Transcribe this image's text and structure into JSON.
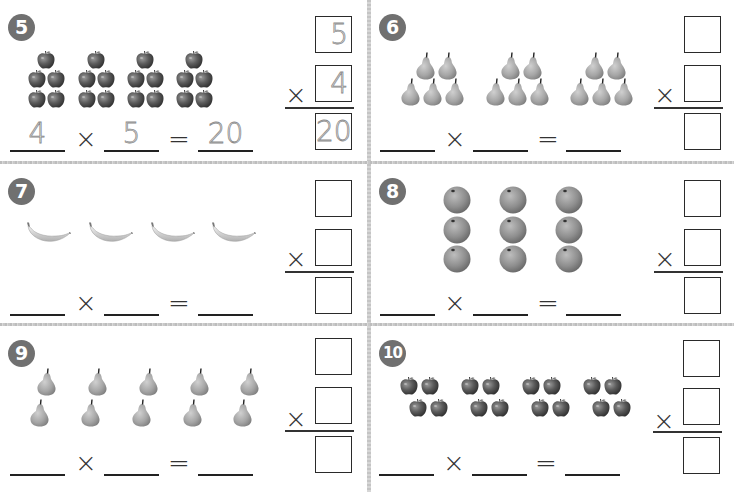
{
  "worksheet": {
    "type": "multiplication arrays",
    "problems": [
      {
        "number": "5",
        "fruit": "apple",
        "arrangement": "4 groups of 5 (pyramid: 1 on top, 2x2 below)",
        "groups": 4,
        "per_group": 5,
        "equation": {
          "factor1": "4",
          "operator": "×",
          "factor2": "5",
          "equals": "=",
          "product": "20"
        },
        "vertical": {
          "top": "5",
          "operator": "×",
          "bottom": "4",
          "result": "20"
        }
      },
      {
        "number": "6",
        "fruit": "pear",
        "arrangement": "3 groups of 5 (2 on top, 3 below)",
        "groups": 3,
        "per_group": 5,
        "equation": {
          "factor1": "",
          "operator": "×",
          "factor2": "",
          "equals": "=",
          "product": ""
        },
        "vertical": {
          "top": "",
          "operator": "×",
          "bottom": "",
          "result": ""
        }
      },
      {
        "number": "7",
        "fruit": "banana",
        "arrangement": "4 bananas in a row",
        "groups": 4,
        "per_group": 1,
        "equation": {
          "factor1": "",
          "operator": "×",
          "factor2": "",
          "equals": "=",
          "product": ""
        },
        "vertical": {
          "top": "",
          "operator": "×",
          "bottom": "",
          "result": ""
        }
      },
      {
        "number": "8",
        "fruit": "orange",
        "arrangement": "3 columns of 3",
        "groups": 3,
        "per_group": 3,
        "equation": {
          "factor1": "",
          "operator": "×",
          "factor2": "",
          "equals": "=",
          "product": ""
        },
        "vertical": {
          "top": "",
          "operator": "×",
          "bottom": "",
          "result": ""
        }
      },
      {
        "number": "9",
        "fruit": "pear",
        "arrangement": "5 columns of 2",
        "groups": 5,
        "per_group": 2,
        "equation": {
          "factor1": "",
          "operator": "×",
          "factor2": "",
          "equals": "=",
          "product": ""
        },
        "vertical": {
          "top": "",
          "operator": "×",
          "bottom": "",
          "result": ""
        }
      },
      {
        "number": "10",
        "fruit": "apple",
        "arrangement": "4 groups of 4 (2 on top, 2 offset below)",
        "groups": 4,
        "per_group": 4,
        "equation": {
          "factor1": "",
          "operator": "×",
          "factor2": "",
          "equals": "=",
          "product": ""
        },
        "vertical": {
          "top": "",
          "operator": "×",
          "bottom": "",
          "result": ""
        }
      }
    ]
  },
  "colors": {
    "badge_bg": "#707070",
    "badge_text": "#ffffff",
    "divider": "#c4c4c4",
    "ink": "#222222",
    "traced_digits": "#8a8a8a",
    "apple": "#5a5a5a",
    "pear": "#a8a8a8",
    "orange": "#8f8f8f",
    "banana": "#d8d8d8"
  }
}
